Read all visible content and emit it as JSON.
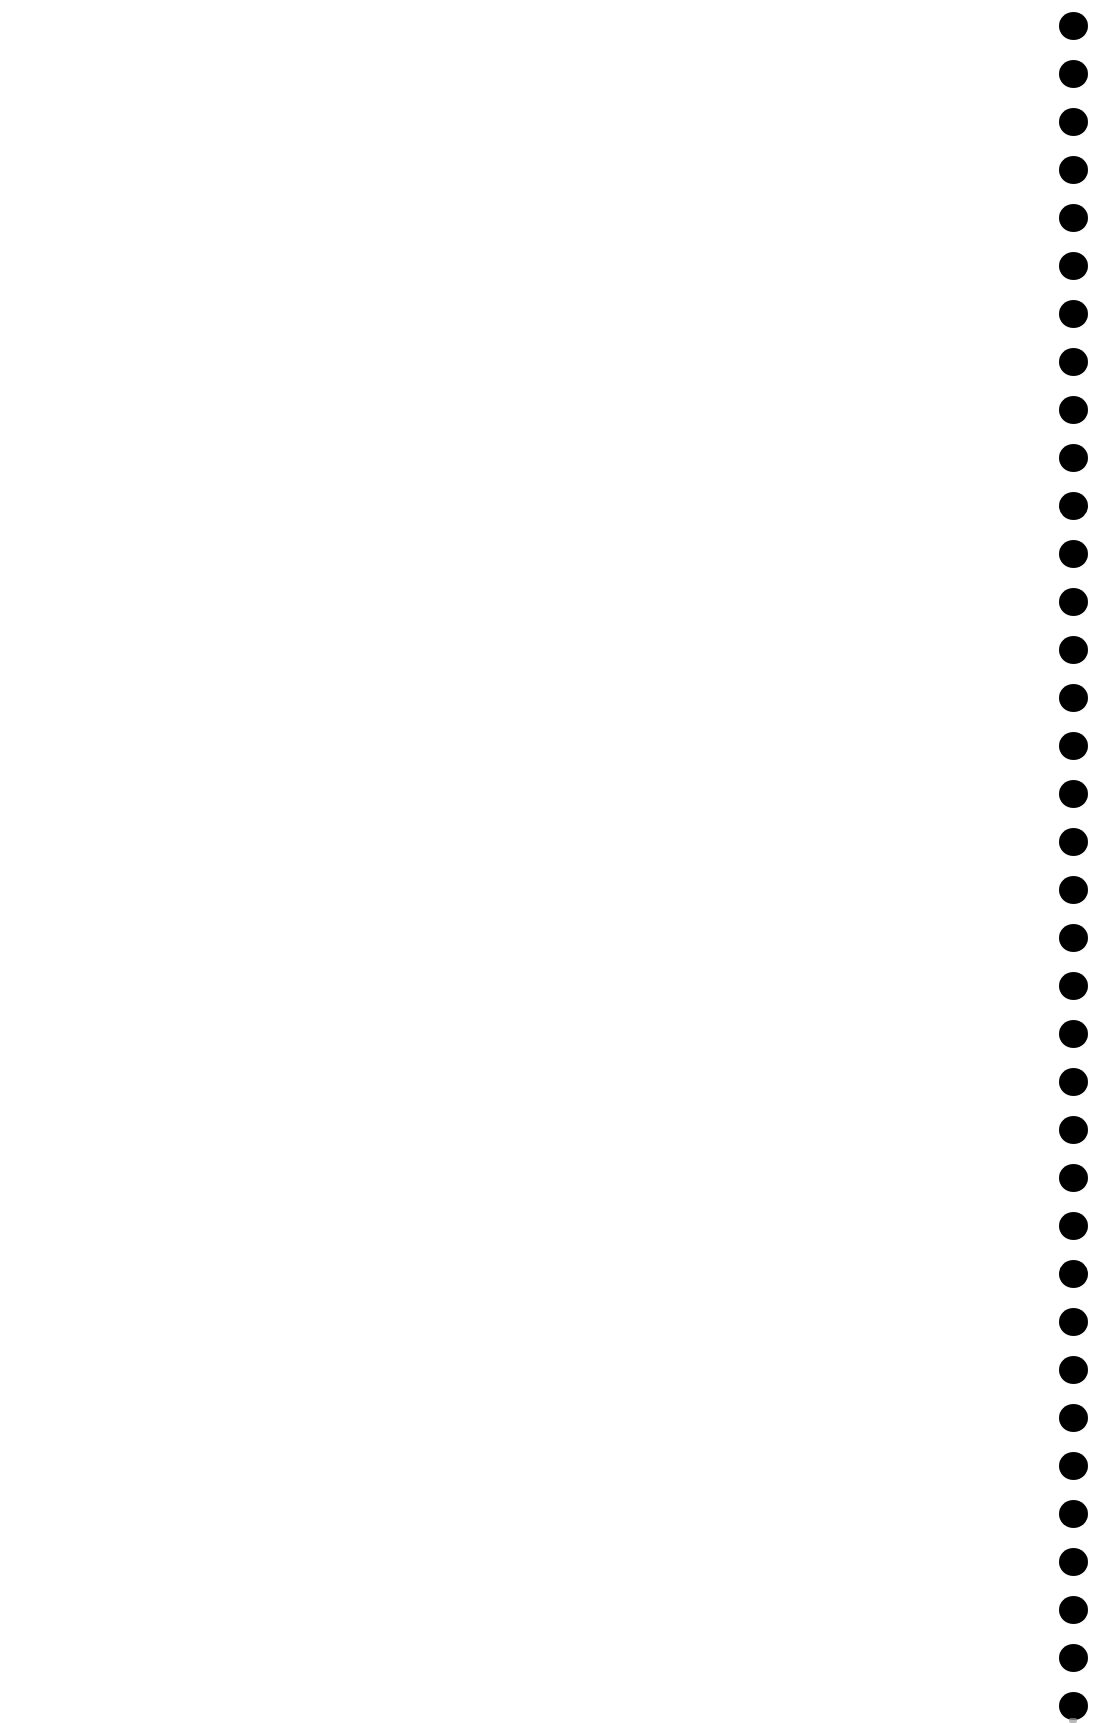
{
  "page": {
    "background_color": "#ffffff"
  },
  "dot_column": {
    "icon": "vertical-dots-icon",
    "count": 36,
    "color": "#000000",
    "first_center_y": 26,
    "spacing": 48,
    "diameter": 29,
    "center_x": 1073
  }
}
